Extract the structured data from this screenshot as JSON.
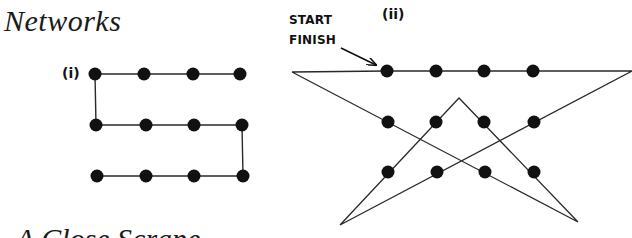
{
  "page": {
    "title": "Networks",
    "footer_title_partial": "A Close Scrape"
  },
  "diagrams": [
    {
      "id": "i",
      "label": "(i)",
      "nodes": [
        {
          "x": 95,
          "y": 74
        },
        {
          "x": 144,
          "y": 74
        },
        {
          "x": 193,
          "y": 74
        },
        {
          "x": 240,
          "y": 74
        },
        {
          "x": 96,
          "y": 125
        },
        {
          "x": 146,
          "y": 125
        },
        {
          "x": 194,
          "y": 125
        },
        {
          "x": 242,
          "y": 125
        },
        {
          "x": 97,
          "y": 176
        },
        {
          "x": 146,
          "y": 176
        },
        {
          "x": 194,
          "y": 176
        },
        {
          "x": 243,
          "y": 176
        }
      ],
      "path": [
        [
          240,
          74
        ],
        [
          95,
          74
        ],
        [
          96,
          125
        ],
        [
          242,
          125
        ],
        [
          243,
          176
        ],
        [
          97,
          176
        ]
      ]
    },
    {
      "id": "ii",
      "label": "(ii)",
      "start_label": "START",
      "finish_label": "FINISH",
      "nodes": [
        {
          "x": 387,
          "y": 71
        },
        {
          "x": 436,
          "y": 71
        },
        {
          "x": 484,
          "y": 71
        },
        {
          "x": 533,
          "y": 71
        },
        {
          "x": 388,
          "y": 122
        },
        {
          "x": 436,
          "y": 122
        },
        {
          "x": 484,
          "y": 122
        },
        {
          "x": 534,
          "y": 122
        },
        {
          "x": 388,
          "y": 172
        },
        {
          "x": 437,
          "y": 172
        },
        {
          "x": 485,
          "y": 172
        },
        {
          "x": 534,
          "y": 172
        }
      ],
      "path": [
        [
          387,
          71
        ],
        [
          632,
          71
        ],
        [
          340,
          225
        ],
        [
          459,
          98
        ],
        [
          578,
          222
        ],
        [
          292,
          72
        ],
        [
          387,
          71
        ]
      ],
      "arrow": {
        "from": [
          341,
          48
        ],
        "to": [
          376,
          65
        ]
      }
    }
  ],
  "colors": {
    "ink": "#111111",
    "line": "#2a2a2a",
    "background": "#ffffff"
  }
}
